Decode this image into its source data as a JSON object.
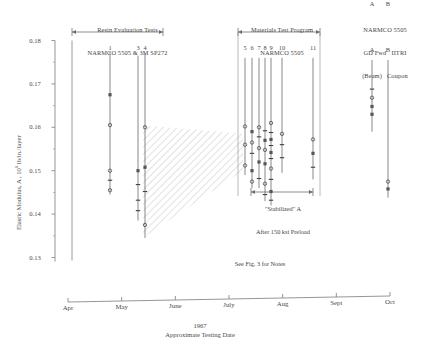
{
  "figure": {
    "caption_note": "See Fig. 3 for Notes"
  },
  "groups": {
    "left": {
      "title_line1": "Resin Evaluation Tests",
      "title_line2": "NARMCO 5505 & 3M SP272"
    },
    "middle": {
      "title_line1": "Materials Test Program",
      "title_line2": "NARMCO 5505"
    },
    "right": {
      "title_line1": "NARMCO 5505",
      "title_line2": "GD Fwd   IITRI",
      "title_line3": "(Beam)   Coupon",
      "col_a": "A",
      "col_b": "B"
    },
    "stabilized": {
      "line1": "\"Stabilized\" A",
      "line2": "After 150 ksi Preload"
    }
  },
  "chart_data": {
    "type": "scatter",
    "title": "",
    "xlabel": "Approximate Testing Date",
    "xlabel_year": "1967",
    "ylabel": "Elastic Modulus, A ,  10",
    "ylabel_exp": "6",
    "ylabel_tail": " lb/in./layer",
    "ylim": [
      0.13,
      0.18
    ],
    "ytick_labels": [
      "0.18",
      "0.17",
      "0.16",
      "0.15",
      "0.14",
      "0.13"
    ],
    "ytick_values": [
      0.18,
      0.17,
      0.16,
      0.15,
      0.14,
      0.13
    ],
    "yminor_values": [
      0.175,
      0.165,
      0.155,
      0.145,
      0.135
    ],
    "xtick_labels": [
      "Apr",
      "May",
      "June",
      "July",
      "Aug",
      "Sept",
      "Oct"
    ],
    "grid": false,
    "legend": "none",
    "series": [
      {
        "name": "1",
        "x_px": 110,
        "range": [
          0.1445,
          0.1775
        ],
        "points": [
          0.1675,
          0.1605,
          0.15,
          0.1478,
          0.1455
        ]
      },
      {
        "name": "3",
        "x_px": 138,
        "range": [
          0.1385,
          0.1765
        ],
        "points": [
          0.15,
          0.1468,
          0.1432,
          0.1408
        ]
      },
      {
        "name": "4",
        "x_px": 145,
        "range": [
          0.1345,
          0.177
        ],
        "points": [
          0.16,
          0.1508,
          0.1452,
          0.1375
        ]
      },
      {
        "name": "5",
        "x_px": 245,
        "range": [
          0.149,
          0.176
        ],
        "points": [
          0.1602,
          0.156,
          0.1512
        ]
      },
      {
        "name": "6",
        "x_px": 252,
        "range": [
          0.146,
          0.176
        ],
        "points": [
          0.159,
          0.1565,
          0.154,
          0.15,
          0.1475
        ]
      },
      {
        "name": "7",
        "x_px": 259,
        "range": [
          0.146,
          0.176
        ],
        "points": [
          0.16,
          0.1578,
          0.1552,
          0.152,
          0.1482
        ]
      },
      {
        "name": "8",
        "x_px": 265,
        "range": [
          0.143,
          0.176
        ],
        "points": [
          0.1592,
          0.157,
          0.1548,
          0.1516,
          0.147,
          0.1445
        ]
      },
      {
        "name": "9",
        "x_px": 271,
        "range": [
          0.142,
          0.176
        ],
        "points": [
          0.161,
          0.1588,
          0.1572,
          0.1558,
          0.1542,
          0.1528,
          0.1505,
          0.148,
          0.1452,
          0.1432
        ]
      },
      {
        "name": "10",
        "x_px": 282,
        "range": [
          0.1495,
          0.176
        ],
        "points": [
          0.1585,
          0.156,
          0.153
        ]
      },
      {
        "name": "11",
        "x_px": 313,
        "range": [
          0.148,
          0.176
        ],
        "points": [
          0.1572,
          0.154,
          0.1508
        ]
      }
    ],
    "right_series": [
      {
        "name": "A",
        "x_px": 372,
        "range": [
          0.159,
          0.1755
        ],
        "points": [
          0.1688,
          0.1668,
          0.1648,
          0.163
        ]
      },
      {
        "name": "B",
        "x_px": 388,
        "range": [
          0.1438,
          0.1755
        ],
        "points": [
          0.1475,
          0.1458
        ]
      }
    ],
    "shaded_band": {
      "label": "scatter-band",
      "x_start_px": 143,
      "x_end_px": 243,
      "top_left": 0.1605,
      "top_right": 0.1585,
      "bottom_left": 0.1345,
      "bottom_right": 0.15
    },
    "reference_line_x_px": 72
  }
}
